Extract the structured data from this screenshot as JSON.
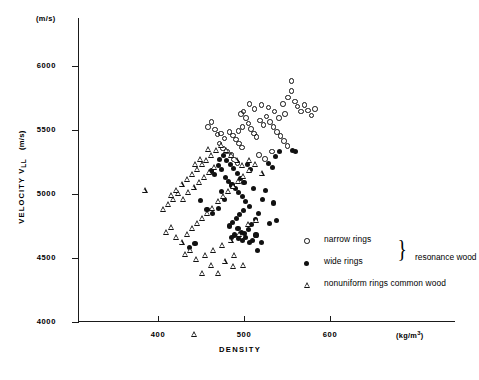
{
  "chart_data": {
    "type": "scatter",
    "title": "",
    "xlabel": "DENSITY",
    "xunits": "(kg/m",
    "xunits_exp": "3",
    "xunits_close": ")",
    "ylabel": "VELOCITY V",
    "ylabel_sub": "LL",
    "yunits": "(m/s)",
    "ytop_units": "(m/s)",
    "xlim": [
      350,
      620
    ],
    "ylim": [
      3800,
      6150
    ],
    "xticks": [
      400,
      500,
      600
    ],
    "yticks": [
      4000,
      4500,
      5000,
      5500,
      6000
    ],
    "grid": false,
    "legend_position": "lower-right",
    "series": [
      {
        "name": "narrow rings",
        "marker": "open-circle",
        "group": "resonance wood",
        "points": [
          [
            459,
            5520
          ],
          [
            463,
            5560
          ],
          [
            467,
            5500
          ],
          [
            470,
            5460
          ],
          [
            474,
            5470
          ],
          [
            478,
            5430
          ],
          [
            472,
            5390
          ],
          [
            476,
            5350
          ],
          [
            481,
            5330
          ],
          [
            486,
            5300
          ],
          [
            489,
            5265
          ],
          [
            493,
            5240
          ],
          [
            484,
            5480
          ],
          [
            488,
            5455
          ],
          [
            491,
            5420
          ],
          [
            495,
            5390
          ],
          [
            498,
            5360
          ],
          [
            494,
            5490
          ],
          [
            499,
            5520
          ],
          [
            497,
            5620
          ],
          [
            503,
            5590
          ],
          [
            506,
            5545
          ],
          [
            509,
            5505
          ],
          [
            512,
            5470
          ],
          [
            515,
            5440
          ],
          [
            519,
            5570
          ],
          [
            523,
            5535
          ],
          [
            527,
            5600
          ],
          [
            531,
            5560
          ],
          [
            535,
            5520
          ],
          [
            539,
            5480
          ],
          [
            543,
            5450
          ],
          [
            547,
            5410
          ],
          [
            551,
            5370
          ],
          [
            546,
            5700
          ],
          [
            552,
            5750
          ],
          [
            556,
            5800
          ],
          [
            560,
            5720
          ],
          [
            563,
            5680
          ],
          [
            567,
            5640
          ],
          [
            571,
            5690
          ],
          [
            575,
            5650
          ],
          [
            579,
            5610
          ],
          [
            583,
            5660
          ],
          [
            556,
            5880
          ],
          [
            548,
            5620
          ],
          [
            541,
            5590
          ],
          [
            536,
            5640
          ],
          [
            529,
            5670
          ],
          [
            521,
            5690
          ],
          [
            513,
            5660
          ],
          [
            507,
            5700
          ],
          [
            500,
            5640
          ],
          [
            518,
            5300
          ],
          [
            525,
            5270
          ],
          [
            533,
            5330
          ]
        ]
      },
      {
        "name": "wide rings",
        "marker": "filled-circle",
        "group": "resonance wood",
        "points": [
          [
            462,
            5180
          ],
          [
            466,
            5150
          ],
          [
            470,
            5220
          ],
          [
            474,
            5190
          ],
          [
            478,
            5130
          ],
          [
            482,
            5100
          ],
          [
            486,
            5070
          ],
          [
            490,
            5040
          ],
          [
            494,
            5010
          ],
          [
            498,
            4980
          ],
          [
            472,
            5270
          ],
          [
            476,
            5300
          ],
          [
            480,
            5260
          ],
          [
            484,
            5230
          ],
          [
            488,
            5200
          ],
          [
            492,
            5160
          ],
          [
            496,
            5120
          ],
          [
            500,
            5090
          ],
          [
            504,
            5230
          ],
          [
            508,
            5190
          ],
          [
            502,
            4940
          ],
          [
            506,
            4900
          ],
          [
            499,
            4870
          ],
          [
            495,
            4840
          ],
          [
            491,
            4810
          ],
          [
            487,
            4780
          ],
          [
            483,
            4750
          ],
          [
            493,
            4730
          ],
          [
            497,
            4700
          ],
          [
            501,
            4690
          ],
          [
            505,
            4720
          ],
          [
            489,
            4680
          ],
          [
            485,
            4660
          ],
          [
            494,
            4650
          ],
          [
            498,
            4640
          ],
          [
            502,
            4660
          ],
          [
            506,
            4620
          ],
          [
            510,
            4640
          ],
          [
            514,
            4680
          ],
          [
            509,
            4760
          ],
          [
            513,
            4800
          ],
          [
            517,
            4850
          ],
          [
            521,
            4960
          ],
          [
            525,
            5030
          ],
          [
            529,
            5240
          ],
          [
            533,
            5210
          ],
          [
            537,
            5290
          ],
          [
            541,
            5330
          ],
          [
            556,
            5340
          ],
          [
            560,
            5330
          ],
          [
            520,
            4620
          ],
          [
            516,
            4560
          ],
          [
            477,
            4960
          ],
          [
            470,
            4890
          ],
          [
            463,
            4850
          ],
          [
            457,
            4880
          ],
          [
            449,
            4950
          ],
          [
            443,
            4610
          ],
          [
            437,
            4580
          ],
          [
            511,
            5040
          ],
          [
            534,
            4930
          ],
          [
            538,
            4790
          ],
          [
            530,
            4770
          ],
          [
            474,
            5020
          ]
        ]
      },
      {
        "name": "nonuniform rings common wood",
        "marker": "open-triangle",
        "group": "common wood",
        "points": [
          [
            385,
            5030
          ],
          [
            406,
            4880
          ],
          [
            412,
            4920
          ],
          [
            418,
            4960
          ],
          [
            424,
            5000
          ],
          [
            430,
            4960
          ],
          [
            436,
            5010
          ],
          [
            442,
            5050
          ],
          [
            448,
            5090
          ],
          [
            454,
            5130
          ],
          [
            460,
            5170
          ],
          [
            466,
            5210
          ],
          [
            452,
            5230
          ],
          [
            446,
            5190
          ],
          [
            440,
            5150
          ],
          [
            434,
            5110
          ],
          [
            428,
            5070
          ],
          [
            422,
            5030
          ],
          [
            416,
            4990
          ],
          [
            410,
            4700
          ],
          [
            416,
            4740
          ],
          [
            422,
            4660
          ],
          [
            428,
            4620
          ],
          [
            434,
            4680
          ],
          [
            440,
            4730
          ],
          [
            446,
            4770
          ],
          [
            452,
            4810
          ],
          [
            458,
            4850
          ],
          [
            464,
            4890
          ],
          [
            470,
            4940
          ],
          [
            476,
            4980
          ],
          [
            482,
            5020
          ],
          [
            488,
            5060
          ],
          [
            494,
            5100
          ],
          [
            500,
            5140
          ],
          [
            506,
            5180
          ],
          [
            498,
            5220
          ],
          [
            492,
            5260
          ],
          [
            486,
            5300
          ],
          [
            480,
            5340
          ],
          [
            474,
            5380
          ],
          [
            468,
            5340
          ],
          [
            462,
            5300
          ],
          [
            456,
            5260
          ],
          [
            450,
            5270
          ],
          [
            444,
            5230
          ],
          [
            438,
            4560
          ],
          [
            432,
            4530
          ],
          [
            445,
            4490
          ],
          [
            455,
            4520
          ],
          [
            465,
            4560
          ],
          [
            475,
            4600
          ],
          [
            485,
            4640
          ],
          [
            495,
            4680
          ],
          [
            505,
            4760
          ],
          [
            515,
            4790
          ],
          [
            478,
            4470
          ],
          [
            488,
            4430
          ],
          [
            462,
            4440
          ],
          [
            470,
            4380
          ],
          [
            443,
            3900
          ],
          [
            507,
            5260
          ],
          [
            513,
            5230
          ],
          [
            521,
            5160
          ],
          [
            500,
            4440
          ],
          [
            489,
            4520
          ],
          [
            459,
            5350
          ],
          [
            452,
            4380
          ]
        ]
      }
    ]
  },
  "legend": {
    "rows": [
      {
        "marker": "open-circle",
        "label": "narrow rings"
      },
      {
        "marker": "filled-circle",
        "label": "wide rings"
      },
      {
        "marker": "open-triangle",
        "label": "nonuniform rings common wood"
      }
    ],
    "brace": "}",
    "group_label": "resonance wood"
  }
}
